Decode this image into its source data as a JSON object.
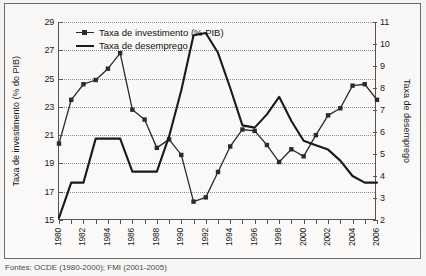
{
  "figure": {
    "source_caption": "Fontes: OCDE (1980-2000); FMI (2001-2005)"
  },
  "legend": {
    "position": "top-left-inside",
    "items": [
      {
        "label": "Taxa de investimento (% PIB)",
        "style": "line-marker",
        "color": "#2b2b2b"
      },
      {
        "label": "Taxa de desemprego",
        "style": "line",
        "color": "#1a1a1a"
      }
    ]
  },
  "axes": {
    "y_left": {
      "title": "Taxa de investimento (% do PIB)",
      "ticks": [
        15,
        17,
        19,
        21,
        23,
        25,
        27,
        29
      ],
      "min": 15,
      "max": 29
    },
    "y_right": {
      "title": "Taxa de desemprego",
      "ticks": [
        2,
        3,
        4,
        5,
        6,
        7,
        8,
        9,
        10,
        11
      ],
      "min": 2,
      "max": 11
    },
    "x": {
      "title": "",
      "ticks": [
        1980,
        1982,
        1984,
        1986,
        1988,
        1990,
        1992,
        1994,
        1996,
        1998,
        2000,
        2002,
        2004,
        2006
      ],
      "min": 1980,
      "max": 2006
    }
  },
  "chart_data": {
    "type": "line",
    "title": "",
    "subtitle": "",
    "xlabel": "",
    "ylabel": "Taxa de investimento (% do PIB)",
    "ylabel_secondary": "Taxa de desemprego",
    "xlim": [
      1980,
      2006
    ],
    "ylim": [
      15,
      29
    ],
    "ylim_secondary": [
      2,
      11
    ],
    "grid": true,
    "grid_axis": "y",
    "legend_position": "upper left",
    "x": [
      1980,
      1981,
      1982,
      1983,
      1984,
      1985,
      1986,
      1987,
      1988,
      1989,
      1990,
      1991,
      1992,
      1993,
      1994,
      1995,
      1996,
      1997,
      1998,
      1999,
      2000,
      2001,
      2002,
      2003,
      2004,
      2005,
      2006
    ],
    "series": [
      {
        "name": "Taxa de investimento (% PIB)",
        "axis": "left",
        "marker": "square",
        "color": "#2b2b2b",
        "values": [
          20.4,
          23.5,
          24.6,
          24.9,
          25.7,
          26.8,
          22.8,
          22.1,
          20.1,
          20.7,
          19.6,
          16.3,
          16.6,
          18.4,
          20.2,
          21.4,
          21.3,
          20.3,
          19.1,
          20.0,
          19.5,
          21.0,
          22.4,
          22.9,
          24.5,
          24.6,
          23.5
        ]
      },
      {
        "name": "Taxa de desemprego",
        "axis": "right",
        "marker": "none",
        "color": "#1a1a1a",
        "values": [
          2.1,
          3.7,
          3.7,
          5.7,
          5.7,
          5.7,
          4.2,
          4.2,
          4.2,
          5.8,
          7.9,
          10.4,
          10.5,
          9.6,
          8.0,
          6.3,
          6.2,
          6.8,
          7.6,
          6.5,
          5.6,
          5.4,
          5.2,
          4.7,
          4.0,
          3.7,
          3.7
        ]
      }
    ]
  }
}
